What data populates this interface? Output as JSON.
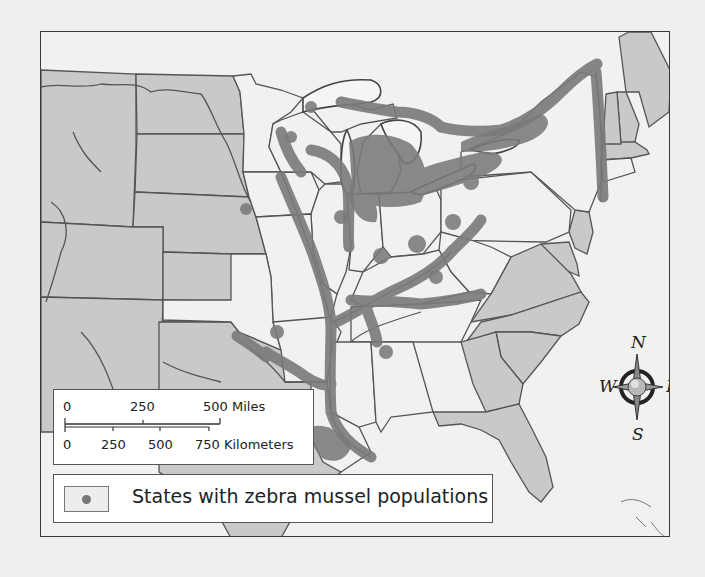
{
  "map": {
    "title": "",
    "colors": {
      "states_with_mussels": "#f1f1ef",
      "states_without_mussels": "#c9c9c7",
      "mussel_overlay": "#7a7a7a",
      "rivers_borders": "#555555",
      "water": "#f1f1ef",
      "frame": "#3a3a3a"
    },
    "states_with_mussels": [
      "Minnesota",
      "Wisconsin",
      "Iowa",
      "Illinois",
      "Michigan",
      "Indiana",
      "Ohio",
      "Pennsylvania",
      "New York",
      "Vermont",
      "Missouri",
      "Kentucky",
      "West Virginia",
      "Tennessee",
      "Arkansas",
      "Oklahoma",
      "Kansas",
      "Louisiana",
      "Mississippi",
      "Alabama",
      "Connecticut"
    ],
    "states_without_mussels": [
      "Montana",
      "Wyoming",
      "Colorado",
      "New Mexico",
      "North Dakota",
      "South Dakota",
      "Nebraska",
      "Texas",
      "Maine",
      "New Hampshire",
      "Massachusetts",
      "New Jersey",
      "Delaware",
      "Maryland",
      "Virginia",
      "North Carolina",
      "South Carolina",
      "Georgia",
      "Florida"
    ]
  },
  "scale_bar": {
    "miles": {
      "ticks": [
        "0",
        "250",
        "500"
      ],
      "unit": "Miles",
      "label_end": "500 Miles"
    },
    "kilometers": {
      "ticks": [
        "0",
        "250",
        "500",
        "750"
      ],
      "unit": "Kilometers",
      "label_end": "750 Kilometers"
    }
  },
  "legend": {
    "items": [
      {
        "label": "States with zebra mussel populations",
        "swatch": "light-state-with-dot"
      }
    ]
  },
  "compass": {
    "north": "N",
    "south": "S",
    "east": "E",
    "west": "W"
  }
}
